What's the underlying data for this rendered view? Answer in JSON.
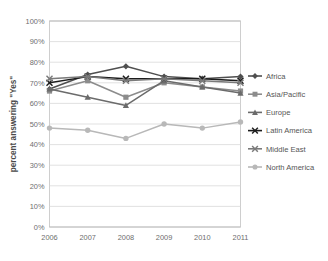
{
  "chart_data": {
    "type": "line",
    "title": "",
    "xlabel": "",
    "ylabel": "percent answering \"Yes\"",
    "categories": [
      "2006",
      "2007",
      "2008",
      "2009",
      "2010",
      "2011"
    ],
    "x": [
      2006,
      2007,
      2008,
      2009,
      2010,
      2011
    ],
    "ylim": [
      0,
      100
    ],
    "yticks": [
      "0%",
      "10%",
      "20%",
      "30%",
      "40%",
      "50%",
      "60%",
      "70%",
      "80%",
      "90%",
      "100%"
    ],
    "ytick_values": [
      0,
      10,
      20,
      30,
      40,
      50,
      60,
      70,
      80,
      90,
      100
    ],
    "grid": "horizontal",
    "legend_position": "right",
    "value_suffix": "%",
    "series": [
      {
        "name": "Africa",
        "values": [
          67,
          74,
          78,
          73,
          72,
          73
        ],
        "color": "#4f4f4f",
        "marker": "diamond"
      },
      {
        "name": "Asia/Pacific",
        "values": [
          66,
          71,
          63,
          70,
          68,
          66
        ],
        "color": "#8c8c8c",
        "marker": "square"
      },
      {
        "name": "Europe",
        "values": [
          67,
          63,
          59,
          71,
          68,
          65
        ],
        "color": "#6b6b6b",
        "marker": "triangle"
      },
      {
        "name": "Latin America",
        "values": [
          70,
          73,
          72,
          72,
          72,
          71
        ],
        "color": "#1c1c1c",
        "marker": "cross"
      },
      {
        "name": "Middle East",
        "values": [
          72,
          73,
          71,
          72,
          71,
          70
        ],
        "color": "#7a7a7a",
        "marker": "cross"
      },
      {
        "name": "North America",
        "values": [
          48,
          47,
          43,
          50,
          48,
          51
        ],
        "color": "#b8b8b8",
        "marker": "circle"
      }
    ]
  }
}
